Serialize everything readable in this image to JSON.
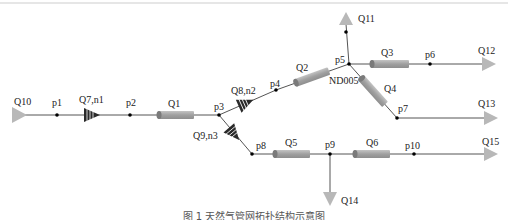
{
  "diagram": {
    "type": "gas-pipeline-network-topology",
    "colors": {
      "line": "#555555",
      "pipe_body": "#a8a8a8",
      "pipe_cap": "#7a7a7a",
      "compressor": "#2a2a2a",
      "arrow": "#b8b8b8",
      "node": "#000000"
    },
    "sources": [
      {
        "id": "Q10",
        "label": "Q10"
      }
    ],
    "sinks": [
      {
        "id": "Q11",
        "label": "Q11"
      },
      {
        "id": "Q12",
        "label": "Q12"
      },
      {
        "id": "Q13",
        "label": "Q13"
      },
      {
        "id": "Q14",
        "label": "Q14"
      },
      {
        "id": "Q15",
        "label": "Q15"
      }
    ],
    "nodes": [
      {
        "id": "p1",
        "label": "p1"
      },
      {
        "id": "p2",
        "label": "p2"
      },
      {
        "id": "p3",
        "label": "p3"
      },
      {
        "id": "p4",
        "label": "p4"
      },
      {
        "id": "p5",
        "label": "p5"
      },
      {
        "id": "p6",
        "label": "p6"
      },
      {
        "id": "p7",
        "label": "p7"
      },
      {
        "id": "p8",
        "label": "p8"
      },
      {
        "id": "p9",
        "label": "p9"
      },
      {
        "id": "p10",
        "label": "p10"
      }
    ],
    "junction_label": "ND005",
    "pipes": [
      {
        "id": "Q1",
        "label": "Q1",
        "from": "p2",
        "to": "p3"
      },
      {
        "id": "Q2",
        "label": "Q2",
        "from": "p4",
        "to": "p5"
      },
      {
        "id": "Q3",
        "label": "Q3",
        "from": "p5",
        "to": "p6"
      },
      {
        "id": "Q4",
        "label": "Q4",
        "from": "p5",
        "to": "p7"
      },
      {
        "id": "Q5",
        "label": "Q5",
        "from": "p8",
        "to": "p9"
      },
      {
        "id": "Q6",
        "label": "Q6",
        "from": "p9",
        "to": "p10"
      }
    ],
    "compressors": [
      {
        "id": "Q7",
        "label": "Q7,n1",
        "from": "p1",
        "to": "p2"
      },
      {
        "id": "Q8",
        "label": "Q8,n2",
        "from": "p3",
        "to": "p4"
      },
      {
        "id": "Q9",
        "label": "Q9,n3",
        "from": "p3",
        "to": "p8"
      }
    ],
    "caption": "图 1  天然气管网拓扑结构示意图"
  }
}
